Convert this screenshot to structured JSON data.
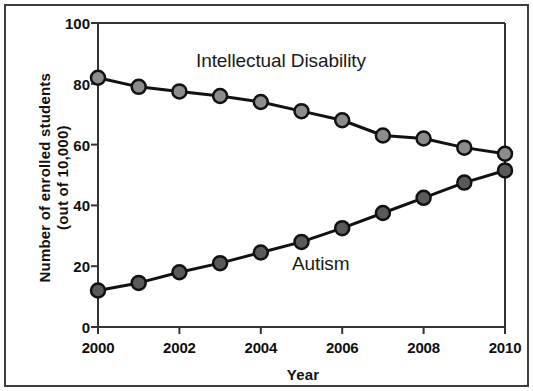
{
  "chart_data": {
    "type": "line",
    "title": "",
    "xlabel": "Year",
    "ylabel": "Number of enrolled students (out of 10,000)",
    "ylabel_line1": "Number of enrolled students",
    "ylabel_line2": "(out of 10,000)",
    "x": [
      2000,
      2001,
      2002,
      2003,
      2004,
      2005,
      2006,
      2007,
      2008,
      2009,
      2010
    ],
    "xtick_values": [
      2000,
      2002,
      2004,
      2006,
      2008,
      2010
    ],
    "xtick_labels": [
      "2000",
      "2002",
      "2004",
      "2006",
      "2008",
      "2010"
    ],
    "ytick_values": [
      0,
      20,
      40,
      60,
      80,
      100
    ],
    "ytick_labels": [
      "0",
      "20",
      "40",
      "60",
      "80",
      "100"
    ],
    "xlim": [
      2000,
      2010
    ],
    "ylim": [
      0,
      100
    ],
    "grid": false,
    "legend_position": "inline-annotations",
    "series": [
      {
        "name": "Intellectual Disability",
        "label_text": "Intellectual Disability",
        "marker": "circle",
        "marker_color": "#8c8c8c",
        "line_color": "#111111",
        "values": [
          82,
          79,
          77.5,
          76,
          74,
          71,
          68,
          63,
          62,
          59,
          57
        ]
      },
      {
        "name": "Autism",
        "label_text": "Autism",
        "marker": "circle",
        "marker_color": "#5a5a5a",
        "line_color": "#111111",
        "values": [
          12,
          14.5,
          18,
          21,
          24.5,
          28,
          32.5,
          37.5,
          42.5,
          47.5,
          51.5
        ]
      }
    ]
  },
  "figure": {
    "background_color": "#ffffff",
    "axis_color": "#333333",
    "text_color": "#101010"
  }
}
